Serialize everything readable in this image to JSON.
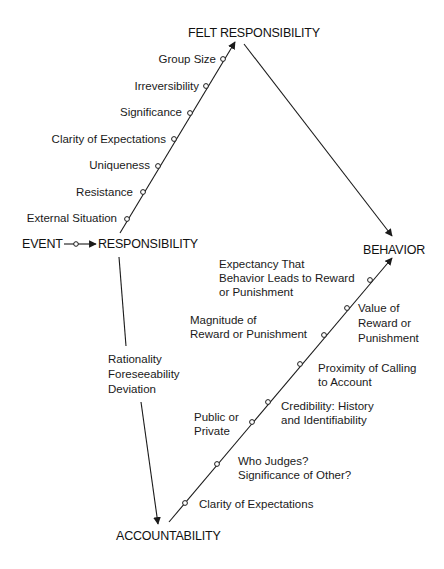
{
  "nodes": {
    "felt_responsibility": "FELT RESPONSIBILITY",
    "event": "EVENT",
    "responsibility": "RESPONSIBILITY",
    "behavior": "BEHAVIOR",
    "accountability": "ACCOUNTABILITY"
  },
  "responsibility_factors": [
    "Group Size",
    "Irreversibility",
    "Significance",
    "Clarity of Expectations",
    "Uniqueness",
    "Resistance",
    "External Situation"
  ],
  "accountability_link_factors": [
    "Rationality",
    "Foreseeability",
    "Deviation"
  ],
  "behavior_factors": {
    "expectancy": [
      "Expectancy That",
      "Behavior Leads to Reward",
      "or Punishment"
    ],
    "value": [
      "Value of",
      "Reward or",
      "Punishment"
    ],
    "magnitude": [
      "Magnitude of",
      "Reward or Punishment"
    ],
    "proximity": [
      "Proximity of Calling",
      "to Account"
    ],
    "credibility": [
      "Credibility: History",
      "and Identifiability"
    ],
    "public": [
      "Public or",
      "Private"
    ],
    "who_judges": [
      "Who Judges?",
      "Significance of Other?"
    ],
    "clarity": [
      "Clarity of Expectations"
    ]
  },
  "colors": {
    "ink": "#1a1a1a",
    "background": "#ffffff"
  }
}
